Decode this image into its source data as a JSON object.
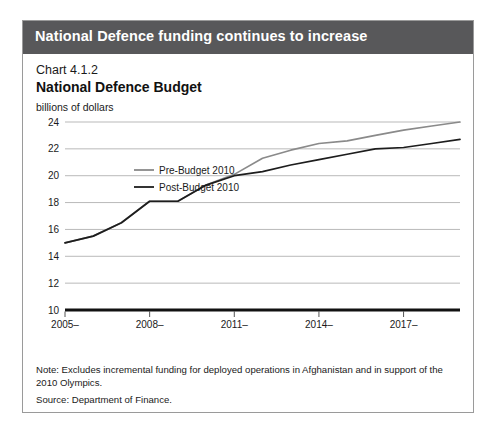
{
  "banner": {
    "title": "National Defence funding continues to increase"
  },
  "chart_number": "Chart 4.1.2",
  "notes": {
    "note": "Note: Excludes incremental funding for deployed operations in Afghanistan and in support of the 2010 Olympics.",
    "source": "Source: Department of Finance."
  },
  "colors": {
    "banner_bg": "#58585a",
    "frame_border": "#9a9a9a",
    "gridline": "#b9b9b9",
    "axis": "#111111",
    "pre_budget": "#8a8a8a",
    "post_budget": "#1d1d1d"
  },
  "chart_data": {
    "type": "line",
    "title": "National Defence Budget",
    "subtitle": "Chart 4.1.2",
    "xlabel": "",
    "ylabel": "billions of dollars",
    "ylim": [
      10,
      24
    ],
    "yticks": [
      10,
      12,
      14,
      16,
      18,
      20,
      22,
      24
    ],
    "grid": true,
    "legend_position": "upper-left-inside",
    "x": [
      "2005-2006",
      "2006-2007",
      "2007-2008",
      "2008-2009",
      "2009-2010",
      "2010-2011",
      "2011-2012",
      "2012-2013",
      "2013-2014",
      "2014-2015",
      "2015-2016",
      "2016-2017",
      "2017-2018",
      "2018-2019",
      "2019-2020"
    ],
    "xtick_labels": [
      "2005–\n2006",
      "2008–\n2009",
      "2011–\n2012",
      "2014–\n2015",
      "2017–\n2018"
    ],
    "xtick_positions": [
      "2005-2006",
      "2008-2009",
      "2011-2012",
      "2014-2015",
      "2017-2018"
    ],
    "series": [
      {
        "name": "Pre-Budget 2010",
        "color": "#8a8a8a",
        "values": [
          15.0,
          15.5,
          16.5,
          18.1,
          18.1,
          19.3,
          20.1,
          21.3,
          21.9,
          22.4,
          22.6,
          23.0,
          23.4,
          23.7,
          24.0
        ]
      },
      {
        "name": "Post-Budget 2010",
        "color": "#1d1d1d",
        "values": [
          15.0,
          15.5,
          16.5,
          18.1,
          18.1,
          19.3,
          20.0,
          20.3,
          20.8,
          21.2,
          21.6,
          22.0,
          22.1,
          22.4,
          22.7
        ]
      }
    ]
  }
}
